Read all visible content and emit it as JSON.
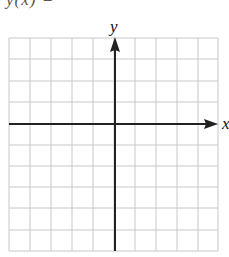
{
  "header": {
    "clipped_text": "y(x) ="
  },
  "graph": {
    "x_label": "x",
    "y_label": "y",
    "grid_cols": 10,
    "grid_rows": 10,
    "grid_color": "#c8c8c8",
    "axis_color": "#222222"
  }
}
